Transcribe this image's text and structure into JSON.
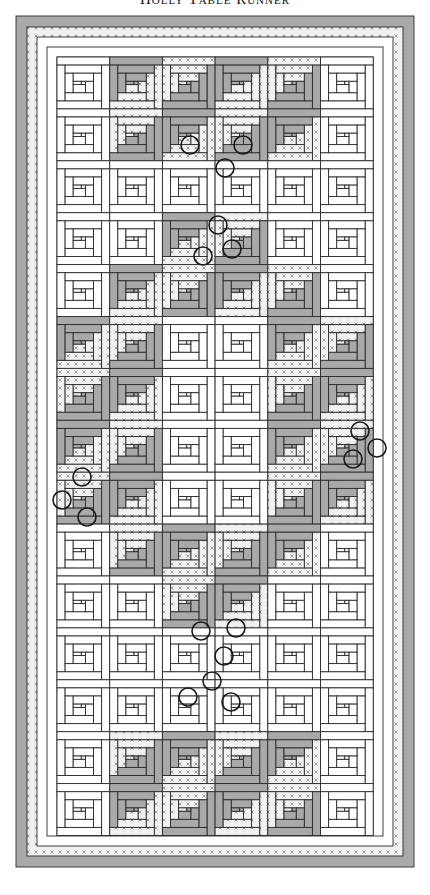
{
  "title": "Holly Table Runner",
  "colors": {
    "outline": "#2a2a2a",
    "gray": "#a9a9a9",
    "print_bg": "#f1f1f1",
    "print_mark": "#8a8a8a",
    "white": "#ffffff",
    "circle": "#1a1a1a"
  },
  "frame": {
    "x": 16,
    "y": 16,
    "width": 398,
    "height": 851,
    "bands": [
      {
        "name": "outer-gray-border",
        "inset": 0,
        "width": 11,
        "fill": "gray"
      },
      {
        "name": "print-border",
        "inset": 11,
        "width": 10,
        "fill": "print"
      },
      {
        "name": "white-border-1",
        "inset": 21,
        "width": 10,
        "fill": "white"
      },
      {
        "name": "white-border-2",
        "inset": 31,
        "width": 10,
        "fill": "white"
      }
    ]
  },
  "grid": {
    "x": 57,
    "y": 57,
    "cols": 6,
    "rows": 15,
    "cell_w": 52.7,
    "cell_h": 51.9,
    "legend": {
      "w": "plain log cabin (white)",
      "g": "gray log cabin",
      "p": "print log cabin",
      "G": "gray/print mixed log cabin"
    },
    "layout": [
      "wGGGGw",
      "wGGGGw",
      "wwwwww",
      "wwGGww",
      "wGGGGw",
      "GGwwGG",
      "GGwwGG",
      "GGwwGG",
      "GGwwGG",
      "wGGGGw",
      "wwGGww",
      "wwwwww",
      "wwwwww",
      "wGGGGw",
      "wGGGGw"
    ]
  },
  "circles": [
    {
      "x": 190,
      "y": 145,
      "r": 9
    },
    {
      "x": 243,
      "y": 145,
      "r": 9
    },
    {
      "x": 225,
      "y": 168,
      "r": 9
    },
    {
      "x": 218,
      "y": 225,
      "r": 9
    },
    {
      "x": 203,
      "y": 256,
      "r": 9
    },
    {
      "x": 232,
      "y": 249,
      "r": 9
    },
    {
      "x": 360,
      "y": 431,
      "r": 9
    },
    {
      "x": 377,
      "y": 448,
      "r": 9
    },
    {
      "x": 353,
      "y": 459,
      "r": 9
    },
    {
      "x": 82,
      "y": 477,
      "r": 9
    },
    {
      "x": 62,
      "y": 500,
      "r": 9
    },
    {
      "x": 87,
      "y": 517,
      "r": 9
    },
    {
      "x": 201,
      "y": 631,
      "r": 9
    },
    {
      "x": 236,
      "y": 628,
      "r": 9
    },
    {
      "x": 224,
      "y": 656,
      "r": 9
    },
    {
      "x": 212,
      "y": 681,
      "r": 9
    },
    {
      "x": 188,
      "y": 697,
      "r": 9
    },
    {
      "x": 231,
      "y": 702,
      "r": 9
    }
  ]
}
